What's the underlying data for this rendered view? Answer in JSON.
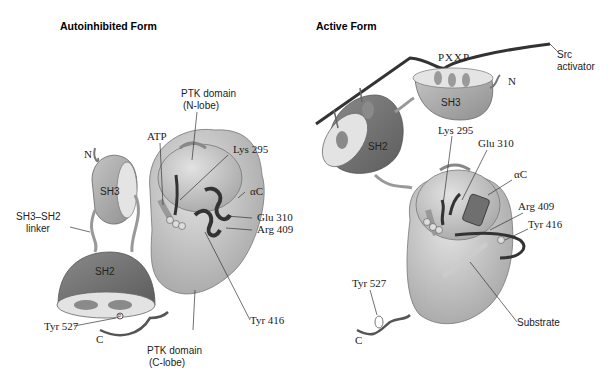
{
  "panels": [
    {
      "title": "Autoinhibited Form",
      "labels": {
        "ptk_n": [
          "PTK domain",
          "(N-lobe)"
        ],
        "atp": "ATP",
        "lys": "Lys 295",
        "n_term": "N",
        "sh3": "SH3",
        "alpha_c": "αC",
        "linker": [
          "SH3–SH2",
          "linker"
        ],
        "glu": "Glu 310",
        "arg": "Arg 409",
        "sh2": "SH2",
        "tyr527": "Tyr 527",
        "c_term": "C",
        "tyr416": "Tyr 416",
        "ptk_c": [
          "PTK domain",
          "(C-lobe)"
        ],
        "phos": "P"
      }
    },
    {
      "title": "Active Form",
      "labels": {
        "motif": "PXXP",
        "src": [
          "Src",
          "activator"
        ],
        "n_term": "N",
        "sh3": "SH3",
        "sh2": "SH2",
        "lys": "Lys 295",
        "glu": "Glu 310",
        "alpha_c": "αC",
        "arg": "Arg 409",
        "tyr416": "Tyr 416",
        "tyr527": "Tyr 527",
        "substrate": "Substrate",
        "c_term": "C",
        "phos": "P"
      }
    }
  ],
  "colors": {
    "lobe": "#cfcfcf",
    "lobe_dark": "#a9a9a9",
    "sh2": "#7d7d7d",
    "sh3": "#b5b5b5",
    "chain": "#3a3a3a",
    "helix": "#6f6f6f"
  }
}
